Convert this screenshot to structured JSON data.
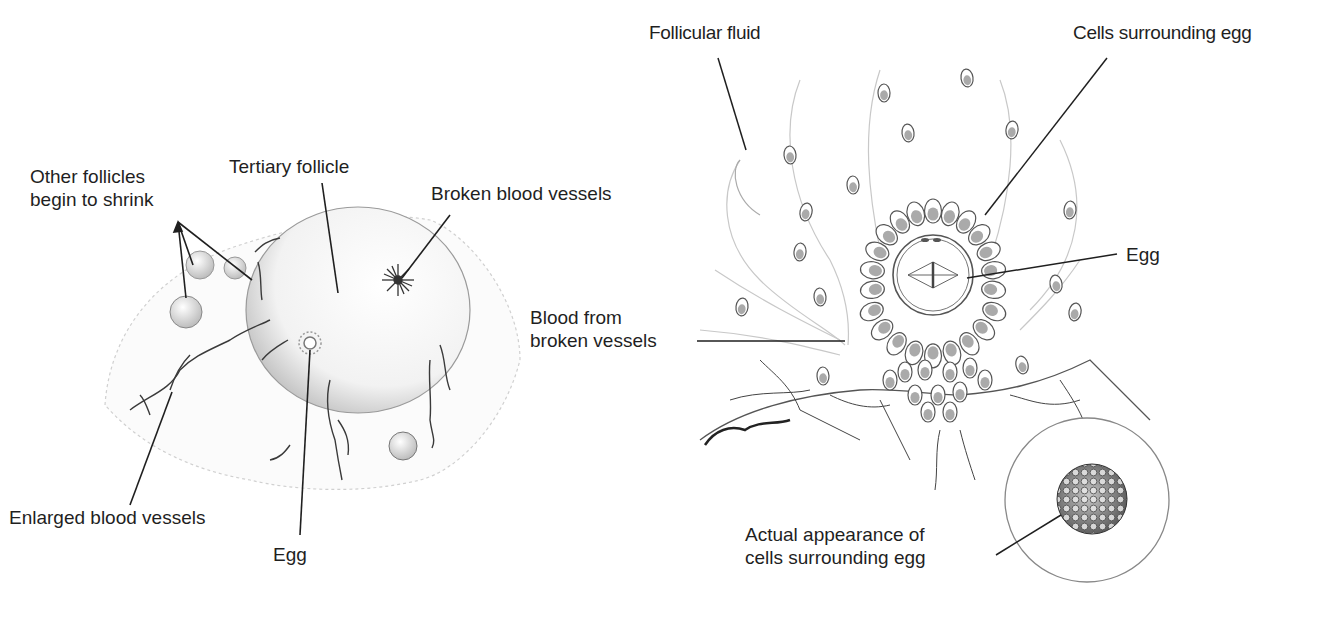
{
  "diagram": {
    "left_panel": {
      "labels": {
        "other_follicles": [
          "Other follicles",
          "begin to shrink"
        ],
        "tertiary_follicle": "Tertiary follicle",
        "broken_blood_vessels": "Broken blood vessels",
        "enlarged_blood_vessels": "Enlarged blood vessels",
        "egg": "Egg"
      }
    },
    "right_panel": {
      "labels": {
        "follicular_fluid": "Follicular fluid",
        "cells_surrounding_egg": "Cells surrounding egg",
        "egg": "Egg",
        "blood_from_broken_vessels": [
          "Blood from",
          "broken vessels"
        ],
        "actual_appearance": [
          "Actual appearance of",
          "cells surrounding egg"
        ]
      }
    },
    "colors": {
      "ink": "#1f1f1f",
      "sketch": "#8a8a8a",
      "shade": "#b5b5b5",
      "background": "#ffffff"
    }
  }
}
